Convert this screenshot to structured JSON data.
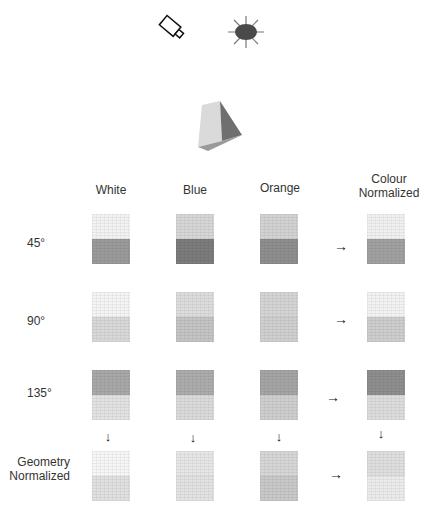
{
  "figure": {
    "icons": {
      "camera": "camera-icon",
      "light": "light-source-icon",
      "object": "cube-object-icon"
    },
    "columns": [
      {
        "label": "White"
      },
      {
        "label": "Blue"
      },
      {
        "label": "Orange"
      },
      {
        "label_line1": "Colour",
        "label_line2": "Normalized"
      }
    ],
    "rows": [
      {
        "label": "45°",
        "swatches": [
          {
            "top": "#f2f2f2",
            "bottom": "#9a9a9a"
          },
          {
            "top": "#d6d6d6",
            "bottom": "#7c7c7c"
          },
          {
            "top": "#d2d2d2",
            "bottom": "#8e8e8e"
          },
          {
            "top": "#f0f0f0",
            "bottom": "#a0a0a0"
          }
        ]
      },
      {
        "label": "90°",
        "swatches": [
          {
            "top": "#f4f4f4",
            "bottom": "#d8d8d8"
          },
          {
            "top": "#dcdcdc",
            "bottom": "#c4c4c4"
          },
          {
            "top": "#d4d4d4",
            "bottom": "#cfcfcf"
          },
          {
            "top": "#f2f2f2",
            "bottom": "#cdcdcd"
          }
        ]
      },
      {
        "label": "135°",
        "swatches": [
          {
            "top": "#a8a8a8",
            "bottom": "#e2e2e2"
          },
          {
            "top": "#acacac",
            "bottom": "#dadada"
          },
          {
            "top": "#a4a4a4",
            "bottom": "#cecece"
          },
          {
            "top": "#8e8e8e",
            "bottom": "#dcdcdc"
          }
        ]
      },
      {
        "label_line1": "Geometry",
        "label_line2": "Normalized",
        "swatches": [
          {
            "top": "#f6f6f6",
            "bottom": "#e0e0e0"
          },
          {
            "top": "#e6e6e6",
            "bottom": "#e2e2e2"
          },
          {
            "top": "#d6d6d6",
            "bottom": "#c8c8c8"
          },
          {
            "top": "#dedede",
            "bottom": "#ebebeb"
          }
        ]
      }
    ],
    "arrow_right": "→",
    "arrow_down": "↓"
  }
}
